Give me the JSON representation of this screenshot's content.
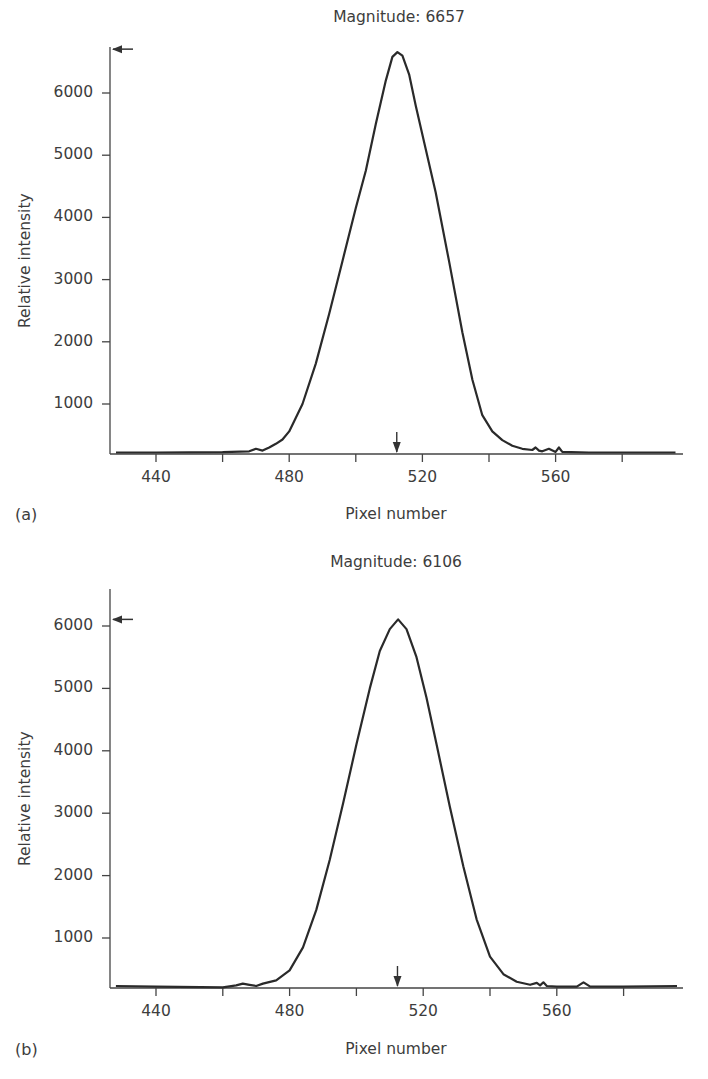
{
  "chart_data": [
    {
      "type": "line",
      "panel_label": "(a)",
      "title": "Magnitude: 6657",
      "xlabel": "Pixel number",
      "ylabel": "Relative intensity",
      "x_ticks": [
        440,
        480,
        520,
        560
      ],
      "x_minor_ticks": [
        460,
        500,
        540,
        580
      ],
      "y_ticks": [
        1000,
        2000,
        3000,
        4000,
        5000,
        6000
      ],
      "xlim": [
        428,
        596
      ],
      "ylim": [
        200,
        6900
      ],
      "grid": false,
      "peak_marker_x": 512,
      "peak_marker_y": 6657,
      "series": [
        {
          "name": "intensity",
          "x": [
            428,
            440,
            460,
            468,
            470,
            472,
            474,
            476,
            478,
            480,
            484,
            488,
            492,
            496,
            500,
            503,
            506,
            509,
            511,
            512.5,
            514,
            516,
            518,
            521,
            524,
            528,
            532,
            535,
            538,
            541,
            544,
            547,
            550,
            553,
            554,
            555,
            556,
            558,
            560,
            561,
            562,
            570,
            580,
            596
          ],
          "y": [
            220,
            220,
            225,
            240,
            280,
            250,
            300,
            360,
            430,
            560,
            1000,
            1650,
            2450,
            3300,
            4150,
            4750,
            5500,
            6200,
            6580,
            6657,
            6600,
            6300,
            5800,
            5100,
            4400,
            3300,
            2150,
            1390,
            820,
            560,
            420,
            330,
            280,
            260,
            300,
            250,
            240,
            280,
            230,
            300,
            230,
            220,
            220,
            220
          ]
        }
      ]
    },
    {
      "type": "line",
      "panel_label": "(b)",
      "title": "Magnitude: 6106",
      "xlabel": "Pixel number",
      "ylabel": "Relative intensity",
      "x_ticks": [
        440,
        480,
        520,
        560
      ],
      "x_minor_ticks": [
        460,
        500,
        540,
        580
      ],
      "y_ticks": [
        1000,
        2000,
        3000,
        4000,
        5000,
        6000
      ],
      "xlim": [
        428,
        596
      ],
      "ylim": [
        200,
        6600
      ],
      "grid": false,
      "peak_marker_x": 512,
      "peak_marker_y": 6106,
      "series": [
        {
          "name": "intensity",
          "x": [
            428,
            440,
            460,
            464,
            466,
            468,
            470,
            472,
            476,
            480,
            484,
            488,
            492,
            496,
            500,
            504,
            507,
            510,
            512.5,
            515,
            518,
            521,
            524,
            528,
            532,
            536,
            540,
            544,
            548,
            552,
            554,
            555,
            556,
            557,
            560,
            566,
            568,
            570,
            580,
            596
          ],
          "y": [
            230,
            220,
            210,
            240,
            270,
            250,
            230,
            270,
            320,
            480,
            850,
            1450,
            2250,
            3150,
            4100,
            5000,
            5600,
            5950,
            6106,
            5950,
            5500,
            4850,
            4100,
            3100,
            2150,
            1300,
            700,
            420,
            300,
            250,
            280,
            240,
            290,
            230,
            220,
            220,
            290,
            220,
            220,
            230
          ]
        }
      ]
    }
  ]
}
